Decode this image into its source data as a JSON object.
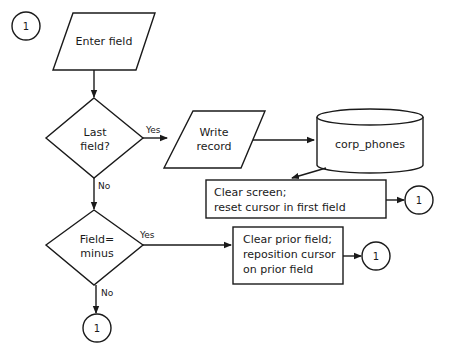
{
  "diagram": {
    "type": "flowchart",
    "nodes": {
      "connector_start": {
        "label": "1",
        "shape": "circle"
      },
      "enter_field": {
        "label": "Enter field",
        "shape": "parallelogram"
      },
      "last_field": {
        "line1": "Last",
        "line2": "field?",
        "shape": "diamond"
      },
      "write_record": {
        "line1": "Write",
        "line2": "record",
        "shape": "parallelogram"
      },
      "corp_phones": {
        "label": "corp_phones",
        "shape": "cylinder"
      },
      "clear_screen": {
        "line1": "Clear screen;",
        "line2": "reset cursor in first field",
        "shape": "rectangle"
      },
      "connector_clear_screen": {
        "label": "1",
        "shape": "circle"
      },
      "field_minus": {
        "line1": "Field=",
        "line2": "minus",
        "shape": "diamond"
      },
      "clear_prior": {
        "line1": "Clear prior field;",
        "line2": "reposition cursor",
        "line3": "on prior field",
        "shape": "rectangle"
      },
      "connector_clear_prior": {
        "label": "1",
        "shape": "circle"
      },
      "connector_end": {
        "label": "1",
        "shape": "circle"
      }
    },
    "edge_labels": {
      "last_field_yes": "Yes",
      "last_field_no": "No",
      "field_minus_yes": "Yes",
      "field_minus_no": "No"
    },
    "edges": [
      {
        "from": "enter_field",
        "to": "last_field"
      },
      {
        "from": "last_field",
        "to": "write_record",
        "label": "Yes"
      },
      {
        "from": "write_record",
        "to": "corp_phones"
      },
      {
        "from": "corp_phones",
        "to": "clear_screen"
      },
      {
        "from": "clear_screen",
        "to": "connector_clear_screen"
      },
      {
        "from": "last_field",
        "to": "field_minus",
        "label": "No"
      },
      {
        "from": "field_minus",
        "to": "clear_prior",
        "label": "Yes"
      },
      {
        "from": "clear_prior",
        "to": "connector_clear_prior"
      },
      {
        "from": "field_minus",
        "to": "connector_end",
        "label": "No"
      }
    ]
  }
}
